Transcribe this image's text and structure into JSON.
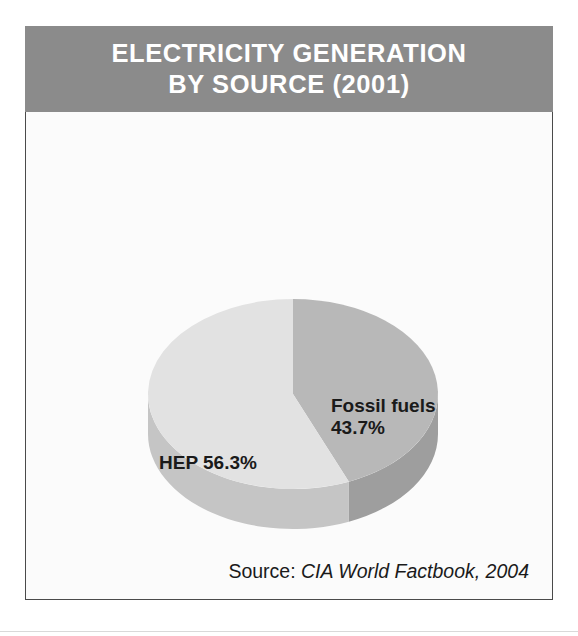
{
  "figure": {
    "title_lines": [
      "ELECTRICITY GENERATION",
      "BY SOURCE (2001)"
    ],
    "source": {
      "label": "Source:",
      "value": "CIA World Factbook, 2004"
    }
  },
  "labels": {
    "fossil_name": "Fossil fuels",
    "fossil_value": "43.7%",
    "hep_text": "HEP 56.3%"
  },
  "colors": {
    "banner_background": "#8b8b8b",
    "banner_text": "#ffffff",
    "panel_background": "#fbfbfb",
    "panel_border": "#4a4a4a",
    "slice_fossil_top": "#b8b8b8",
    "slice_fossil_side": "#9e9e9e",
    "slice_hep_top": "#e2e2e2",
    "slice_hep_side": "#c5c5c5",
    "label_text": "#1a1a1a"
  },
  "chart_data": {
    "type": "pie",
    "title": "ELECTRICITY GENERATION BY SOURCE (2001)",
    "subtitle": "",
    "xlabel": "",
    "ylabel": "",
    "grid": false,
    "legend_position": "none",
    "labels_position": "inside-slices",
    "three_d": true,
    "start_angle_deg": 90,
    "direction": "clockwise",
    "total": 100,
    "units": "percent",
    "categories": [
      "Fossil fuels",
      "HEP"
    ],
    "values": [
      43.7,
      56.3
    ],
    "slices": [
      {
        "name": "Fossil fuels",
        "value": 43.7,
        "label": "Fossil fuels 43.7%",
        "color": "#b8b8b8",
        "side_color": "#9e9e9e",
        "start_angle_deg": 0.0,
        "end_angle_deg": 157.32
      },
      {
        "name": "HEP",
        "value": 56.3,
        "label": "HEP 56.3%",
        "color": "#e2e2e2",
        "side_color": "#c5c5c5",
        "start_angle_deg": 157.32,
        "end_angle_deg": 360.0
      }
    ],
    "annotations": [
      "Source: CIA World Factbook, 2004"
    ]
  }
}
